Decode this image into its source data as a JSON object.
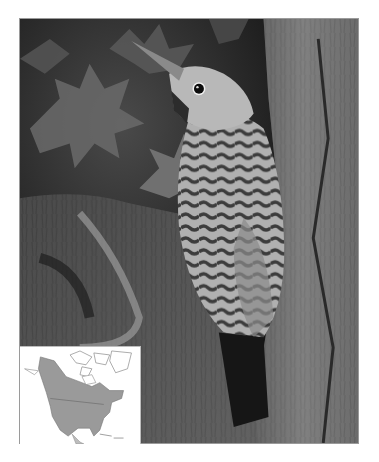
{
  "image": {
    "subject": "Northern Flicker woodpecker clinging to tree trunk",
    "style": "grayscale photograph",
    "colors": {
      "background_dark": "#1e1e1e",
      "leaves": "#6e6e6e",
      "bark": "#707070",
      "bird_body": "#b4b4b4",
      "bird_bars": "#3a3a3a",
      "map_land": "#9a9a9a",
      "map_range": "#8a8a8a",
      "frame_border": "#9a9a9a"
    }
  },
  "inset_map": {
    "region": "North America",
    "shading": "species range"
  }
}
